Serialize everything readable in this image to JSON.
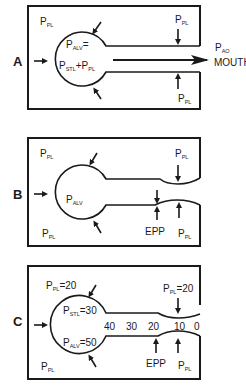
{
  "diagram": {
    "type": "physiology-schematic",
    "panels": [
      {
        "id": "A",
        "label": "A",
        "pleural_top_left": {
          "main": "P",
          "sub": "PL"
        },
        "alveolar_line1": {
          "main": "P",
          "sub": "ALV",
          "suffix": "="
        },
        "alveolar_line2": {
          "main": "P",
          "sub": "STL",
          "mid": "+P",
          "sub2": "PL"
        },
        "pleural_top_right": {
          "main": "P",
          "sub": "PL"
        },
        "pleural_bottom_right": {
          "main": "P",
          "sub": "PL"
        },
        "airway_opening": {
          "main": "P",
          "sub": "AO"
        },
        "mouth": "MOUTH"
      },
      {
        "id": "B",
        "label": "B",
        "pleural_top_left": {
          "main": "P",
          "sub": "PL"
        },
        "alveolar": {
          "main": "P",
          "sub": "ALV"
        },
        "pleural_top_right": {
          "main": "P",
          "sub": "PL"
        },
        "pleural_bottom_left": {
          "main": "P",
          "sub": "PL"
        },
        "pleural_bottom_right": {
          "main": "P",
          "sub": "PL"
        },
        "epp": "EPP"
      },
      {
        "id": "C",
        "label": "C",
        "pleural_top_left": {
          "main": "P",
          "sub": "PL",
          "suffix": "=20"
        },
        "static_recoil": {
          "main": "P",
          "sub": "STL",
          "suffix": "=30"
        },
        "alveolar": {
          "main": "P",
          "sub": "ALV",
          "suffix": "=50"
        },
        "pleural_top_right": {
          "main": "P",
          "sub": "PL",
          "suffix": "=20"
        },
        "pleural_bottom_left": {
          "main": "P",
          "sub": "PL"
        },
        "pleural_bottom_right": {
          "main": "P",
          "sub": "PL"
        },
        "epp": "EPP",
        "airway_pressures": [
          "40",
          "30",
          "20",
          "10",
          "0"
        ]
      }
    ]
  }
}
